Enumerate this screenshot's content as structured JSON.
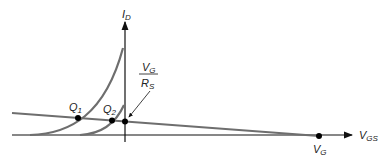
{
  "diagram": {
    "y_axis_label": "I",
    "y_axis_sub": "D",
    "x_axis_label": "V",
    "x_axis_sub": "GS",
    "intercept_label": "V",
    "intercept_sub": "G",
    "fraction_num": "V",
    "fraction_num_sub": "G",
    "fraction_den": "R",
    "fraction_den_sub": "S",
    "q1_label": "Q",
    "q1_sub": "1",
    "q2_label": "Q",
    "q2_sub": "2",
    "colors": {
      "curve": "#6e6e6e",
      "axis": "#111111",
      "load_line": "#6e6e6e",
      "dot": "#000000"
    }
  }
}
